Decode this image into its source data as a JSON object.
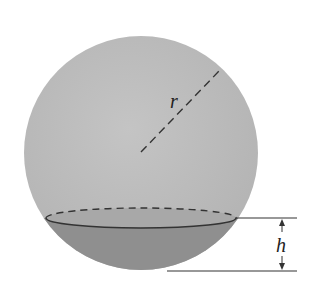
{
  "figure": {
    "labels": {
      "radius": "r",
      "cap_height": "h"
    },
    "colors": {
      "background": "#ffffff",
      "sphere_fill": "#bdbdbd",
      "cap_fill": "#8f8f8f",
      "cap_top_fill": "#a6a6a6",
      "line": "#333333"
    },
    "geometry": {
      "sphere": {
        "cx": 141,
        "cy": 153,
        "r": 117
      },
      "cap_ellipse": {
        "cx": 141,
        "cy": 218,
        "rx": 95,
        "ry": 10
      },
      "radius_line": {
        "x1": 141,
        "y1": 152,
        "x2": 221,
        "y2": 69
      },
      "h_top_line": {
        "x1": 236,
        "y1": 218,
        "x2": 297,
        "y2": 218
      },
      "h_bottom_line": {
        "x1": 167,
        "y1": 271,
        "x2": 297,
        "y2": 271
      },
      "h_arrow_x": 282
    }
  }
}
